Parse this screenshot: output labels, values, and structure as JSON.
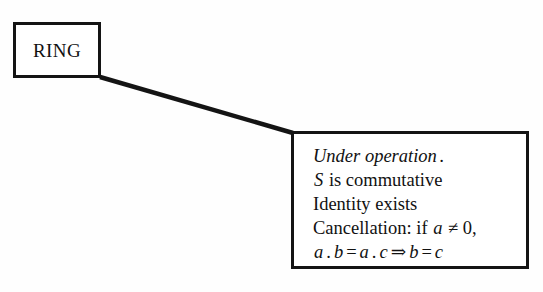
{
  "diagram": {
    "type": "tree-branch",
    "title_node": {
      "label": "RING",
      "style": "roman-serif"
    },
    "detail_node": {
      "lines": [
        {
          "id": "under-operation",
          "text": "Under operation .",
          "segments": [
            {
              "text": "Under operation",
              "style": "italic"
            },
            {
              "text": ".",
              "style": "italic"
            }
          ]
        },
        {
          "id": "commutative",
          "text": "S is commutative",
          "segments": [
            {
              "text": "S",
              "style": "italic"
            },
            {
              "text": " is commutative",
              "style": "roman"
            }
          ]
        },
        {
          "id": "identity",
          "text": "Identity exists",
          "segments": [
            {
              "text": "Identity exists",
              "style": "roman"
            }
          ]
        },
        {
          "id": "cancellation",
          "text": "Cancellation: if a ≠ 0,",
          "segments": [
            {
              "text": "Cancellation: if ",
              "style": "roman"
            },
            {
              "text": "a",
              "style": "italic"
            },
            {
              "text": " ≠ 0,",
              "style": "roman"
            }
          ]
        },
        {
          "id": "cancellation-formula",
          "text": "a . b = a . c ⇒ b = c",
          "segments": [
            {
              "text": "a",
              "style": "italic"
            },
            {
              "text": ".",
              "style": "roman"
            },
            {
              "text": "b",
              "style": "italic"
            },
            {
              "text": "=",
              "style": "roman"
            },
            {
              "text": "a",
              "style": "italic"
            },
            {
              "text": ".",
              "style": "roman"
            },
            {
              "text": "c",
              "style": "italic"
            },
            {
              "text": "⇒",
              "style": "roman"
            },
            {
              "text": "b",
              "style": "italic"
            },
            {
              "text": "=",
              "style": "roman"
            },
            {
              "text": "c",
              "style": "italic"
            }
          ]
        }
      ],
      "line_text": {
        "l1_a": "Under operation",
        "l1_b": ".",
        "l2_a": "S",
        "l2_b": " is commutative",
        "l3": "Identity exists",
        "l4_a": "Cancellation: if ",
        "l4_b": "a",
        "l4_c": " ≠ 0,",
        "l5_a": "a",
        "l5_dot1": ".",
        "l5_b": "b",
        "l5_eq1": "=",
        "l5_c": "a",
        "l5_dot2": ".",
        "l5_d": "c",
        "l5_arrow": "⇒",
        "l5_e": "b",
        "l5_eq2": "=",
        "l5_f": "c"
      }
    },
    "connector": {
      "kind": "elbow-diagonal",
      "from": "ring-node-bottom-right",
      "to": "detail-node-top-left",
      "stroke_width": 4
    },
    "colors": {
      "ink": "#141414",
      "paper": "#fefefe",
      "line": "#141414"
    }
  }
}
